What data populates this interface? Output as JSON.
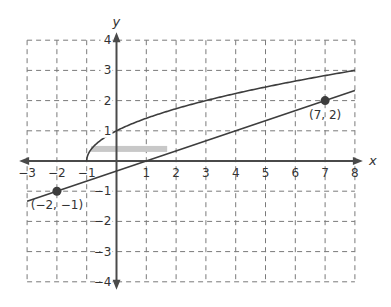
{
  "chart_data": {
    "type": "line",
    "title": "",
    "xlabel": "x",
    "ylabel": "y",
    "xlim": [
      -3,
      8
    ],
    "ylim": [
      -4,
      4
    ],
    "grid": true,
    "grid_style": "dashed",
    "x_ticks": [
      "−3",
      "−2",
      "−1",
      "1",
      "2",
      "3",
      "4",
      "5",
      "6",
      "7",
      "8"
    ],
    "y_ticks": [
      "4",
      "3",
      "2",
      "1",
      "−1",
      "−2",
      "−3",
      "−4"
    ],
    "series": [
      {
        "name": "line",
        "kind": "linear",
        "equation": "y = (x - 1) / 3",
        "x": [
          -3,
          8
        ],
        "y": [
          -1.333,
          2.333
        ]
      },
      {
        "name": "square-root curve",
        "kind": "sqrt",
        "equation": "y = sqrt(x + 1) approx, starting at (-1, 0)",
        "x": [
          -1,
          -0.9,
          -0.75,
          -0.5,
          0,
          1,
          2,
          3,
          4,
          5,
          6,
          7,
          8
        ],
        "y": [
          0,
          0.45,
          0.62,
          0.79,
          1.0,
          1.26,
          1.44,
          1.59,
          1.71,
          1.82,
          1.91,
          2.0,
          2.08
        ]
      }
    ],
    "points": [
      {
        "x": -2,
        "y": -1,
        "label": "(−2, −1)"
      },
      {
        "x": 7,
        "y": 2,
        "label": "(7, 2)"
      }
    ],
    "annotations": [
      {
        "type": "highlight-bar",
        "x_from": -0.85,
        "x_to": 1.7,
        "y": 0.4,
        "color": "#c8c8c8"
      }
    ]
  },
  "colors": {
    "grid": "#7a7a7a",
    "axis": "#4a4a4a",
    "curve": "#3d3d3d",
    "highlight": "#c8c8c8"
  }
}
